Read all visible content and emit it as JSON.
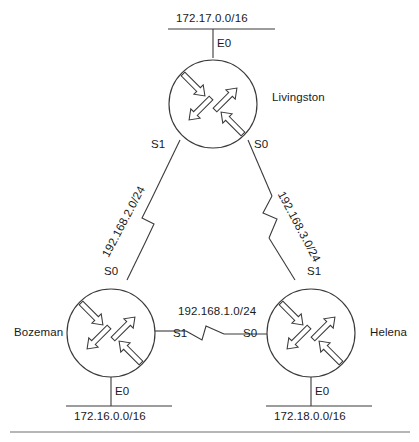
{
  "diagram": {
    "type": "network-topology",
    "stroke_color": "#3a3a3a",
    "text_color": "#1a1a1a",
    "background_color": "#ffffff",
    "routers": [
      {
        "id": "livingston",
        "name": "Livingston",
        "icon": "router-icon",
        "position": "top",
        "interfaces": [
          {
            "name": "E0",
            "side": "top"
          },
          {
            "name": "S1",
            "side": "bottom-left"
          },
          {
            "name": "S0",
            "side": "bottom-right"
          }
        ],
        "lan": {
          "network": "172.17.0.0/16",
          "interface": "E0"
        }
      },
      {
        "id": "bozeman",
        "name": "Bozeman",
        "icon": "router-icon",
        "position": "bottom-left",
        "interfaces": [
          {
            "name": "S0",
            "side": "top"
          },
          {
            "name": "S1",
            "side": "right"
          },
          {
            "name": "E0",
            "side": "bottom"
          }
        ],
        "lan": {
          "network": "172.16.0.0/16",
          "interface": "E0"
        }
      },
      {
        "id": "helena",
        "name": "Helena",
        "icon": "router-icon",
        "position": "bottom-right",
        "interfaces": [
          {
            "name": "S1",
            "side": "top"
          },
          {
            "name": "S0",
            "side": "left"
          },
          {
            "name": "E0",
            "side": "bottom"
          }
        ],
        "lan": {
          "network": "172.18.0.0/16",
          "interface": "E0"
        }
      }
    ],
    "links": [
      {
        "id": "livingston-bozeman",
        "network": "192.168.2.0/24",
        "media": "serial",
        "from": {
          "router": "Livingston",
          "interface": "S1"
        },
        "to": {
          "router": "Bozeman",
          "interface": "S0"
        }
      },
      {
        "id": "livingston-helena",
        "network": "192.168.3.0/24",
        "media": "serial",
        "from": {
          "router": "Livingston",
          "interface": "S0"
        },
        "to": {
          "router": "Helena",
          "interface": "S1"
        }
      },
      {
        "id": "bozeman-helena",
        "network": "192.168.1.0/24",
        "media": "serial",
        "from": {
          "router": "Bozeman",
          "interface": "S1"
        },
        "to": {
          "router": "Helena",
          "interface": "S0"
        }
      }
    ],
    "labels": {
      "top_lan_network": "172.17.0.0/16",
      "top_lan_interface": "E0",
      "livingston_name": "Livingston",
      "livingston_s1": "S1",
      "livingston_s0": "S0",
      "left_serial_network": "192.168.2.0/24",
      "right_serial_network": "192.168.3.0/24",
      "bozeman_name": "Bozeman",
      "bozeman_s0": "S0",
      "bozeman_s1": "S1",
      "bozeman_e0": "E0",
      "bozeman_lan_network": "172.16.0.0/16",
      "helena_name": "Helena",
      "helena_s1": "S1",
      "helena_s0": "S0",
      "helena_e0": "E0",
      "helena_lan_network": "172.18.0.0/16",
      "middle_serial_network": "192.168.1.0/24"
    }
  }
}
